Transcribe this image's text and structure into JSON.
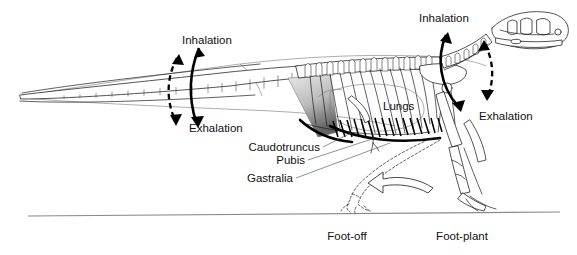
{
  "figure": {
    "background_color": "#ffffff",
    "ink_color": "#111111",
    "ground_color": "#8a8a8a",
    "muscle_shade_color": "#b4b4b4"
  },
  "labels": {
    "inhalation_tail": "Inhalation",
    "exhalation_tail": "Exhalation",
    "inhalation_head": "Inhalation",
    "exhalation_head": "Exhalation",
    "lungs": "Lungs",
    "caudotruncus": "Caudotruncus",
    "pubis": "Pubis",
    "gastralia": "Gastralia",
    "foot_off": "Foot-off",
    "foot_plant": "Foot-plant"
  },
  "anatomy": {
    "parts": [
      "skull",
      "cervical-vertebrae",
      "dorsal-vertebrae",
      "caudal-vertebrae",
      "ribcage",
      "gastralia",
      "pubis",
      "ilium",
      "femur",
      "tibia",
      "pes",
      "forelimb",
      "lungs",
      "caudotruncus-muscle",
      "body-outline"
    ]
  },
  "arrows": {
    "tail_inhalation_style": "solid-curved-up",
    "tail_exhalation_style": "solid-curved-down",
    "tail_dashed_style": "dashed-curved",
    "head_inhalation_style": "solid-curved-up",
    "head_exhalation_style": "solid-curved-down",
    "head_dashed_style": "dashed-curved",
    "limb_swing_style": "open-block-arrow-left"
  }
}
